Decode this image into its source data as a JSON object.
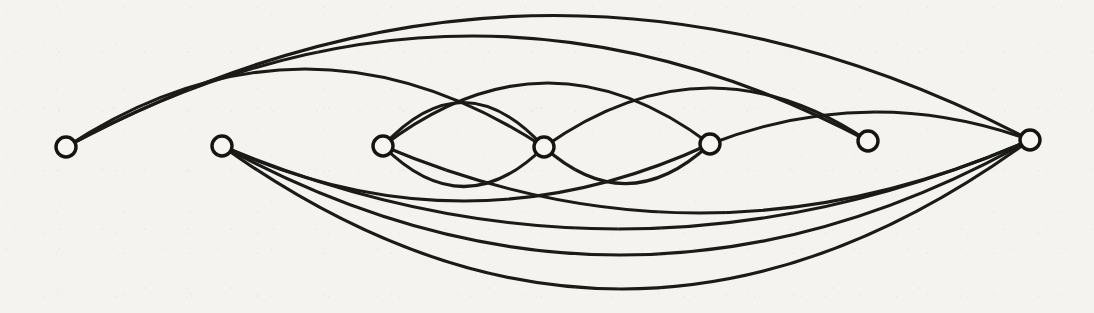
{
  "figure": {
    "background_color": "#f5f3ef",
    "ink_color": "#1a1a18",
    "vertex_fill_color": "#f7f5f1",
    "vertex_radius": 10,
    "edge_stroke_width": 3.1,
    "vertex_count": 7,
    "edge_count": 14
  },
  "chart_data": {
    "type": "diagram",
    "title": "",
    "xlabel": "",
    "ylabel": "",
    "layout": "linear arc diagram, vertices collinear, edges are circular arcs",
    "vertices": [
      {
        "id": "v1",
        "label": "",
        "x": 66,
        "y": 147,
        "degree": 3
      },
      {
        "id": "v2",
        "label": "",
        "x": 222,
        "y": 146,
        "degree": 4
      },
      {
        "id": "v3",
        "label": "",
        "x": 383,
        "y": 146,
        "degree": 4
      },
      {
        "id": "v4",
        "label": "",
        "x": 544,
        "y": 147,
        "degree": 5
      },
      {
        "id": "v5",
        "label": "",
        "x": 710,
        "y": 144,
        "degree": 4
      },
      {
        "id": "v6",
        "label": "",
        "x": 868,
        "y": 141,
        "degree": 3
      },
      {
        "id": "v7",
        "label": "",
        "x": 1030,
        "y": 140,
        "degree": 5
      }
    ],
    "edges": [
      {
        "id": "e1",
        "source": "v1",
        "target": "v7",
        "side": "above",
        "sagitta": 128
      },
      {
        "id": "e2",
        "source": "v1",
        "target": "v6",
        "side": "above",
        "sagitta": 108
      },
      {
        "id": "e3",
        "source": "v1",
        "target": "v4",
        "side": "above",
        "sagitta": 78
      },
      {
        "id": "e4",
        "source": "v3",
        "target": "v5",
        "side": "above",
        "sagitta": 62
      },
      {
        "id": "e5",
        "source": "v4",
        "target": "v6",
        "side": "above",
        "sagitta": 56
      },
      {
        "id": "e6",
        "source": "v3",
        "target": "v4",
        "side": "below",
        "sagitta": 40
      },
      {
        "id": "e7",
        "source": "v4",
        "target": "v5",
        "side": "below",
        "sagitta": 38
      },
      {
        "id": "e8",
        "source": "v2",
        "target": "v5",
        "side": "below",
        "sagitta": 56
      },
      {
        "id": "e9",
        "source": "v2",
        "target": "v7",
        "side": "below",
        "sagitta": 86
      },
      {
        "id": "e10",
        "source": "v2",
        "target": "v7",
        "side": "below",
        "sagitta": 112
      },
      {
        "id": "e11",
        "source": "v2",
        "target": "v7",
        "side": "below",
        "sagitta": 146
      },
      {
        "id": "e12",
        "source": "v3",
        "target": "v7",
        "side": "below",
        "sagitta": 70
      },
      {
        "id": "e13",
        "source": "v5",
        "target": "v7",
        "side": "above",
        "sagitta": 30
      },
      {
        "id": "e14",
        "source": "v4",
        "target": "v3",
        "side": "above",
        "sagitta": 44
      }
    ],
    "annotations": []
  }
}
